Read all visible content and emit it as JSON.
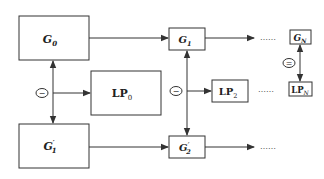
{
  "diagram": {
    "type": "flow-diagram",
    "nodes": {
      "G0": {
        "main": "G",
        "sub": "0",
        "sup": ""
      },
      "G1": {
        "main": "G",
        "sub": "1",
        "sup": ""
      },
      "GN": {
        "main": "G",
        "sub": "N",
        "sup": ""
      },
      "LP0": {
        "main": "LP",
        "sub": "0",
        "sup": ""
      },
      "LP2": {
        "main": "LP",
        "sub": "2",
        "sup": ""
      },
      "LPN": {
        "main": "LP",
        "sub": "N",
        "sup": ""
      },
      "G1p": {
        "main": "G",
        "sub": "1",
        "sup": "′"
      },
      "G2p": {
        "main": "G",
        "sub": "2",
        "sup": "′"
      }
    },
    "operators": {
      "minus_left": "−",
      "minus_mid": "−",
      "equals_right": "="
    },
    "ellipses": {
      "top": "……",
      "middle": "……",
      "bottom": "……"
    },
    "colors": {
      "stroke": "#333333",
      "text": "#222222",
      "background": "#ffffff"
    }
  }
}
